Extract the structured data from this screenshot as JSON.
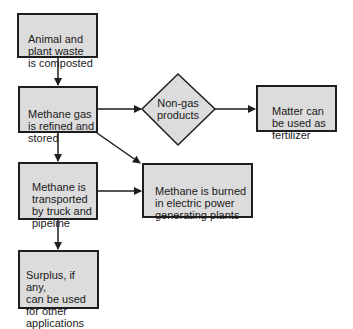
{
  "diagram": {
    "type": "flowchart",
    "colors": {
      "box_fill": "#dcdcdc",
      "border": "#1e1e1e",
      "text": "#1a1a1a",
      "background": "#ffffff"
    },
    "nodes": [
      {
        "id": "composted",
        "shape": "rect",
        "text": "Animal and\nplant waste\nis composted"
      },
      {
        "id": "refined",
        "shape": "rect",
        "text": "Methane gas\nis refined and\nstored"
      },
      {
        "id": "non_gas",
        "shape": "diamond",
        "text": "Non-gas\nproducts"
      },
      {
        "id": "fertilizer",
        "shape": "rect",
        "text": "Matter can\nbe used as\nfertilizer"
      },
      {
        "id": "transported",
        "shape": "rect",
        "text": "Methane is\ntransported\nby truck and\npipeline"
      },
      {
        "id": "burned",
        "shape": "rect",
        "text": "Methane is burned\nin electric power\ngenerating plants"
      },
      {
        "id": "surplus",
        "shape": "rect",
        "text": "Surplus, if any,\ncan be used\nfor other\napplications"
      }
    ],
    "edges": [
      {
        "from": "composted",
        "to": "refined"
      },
      {
        "from": "refined",
        "to": "non_gas"
      },
      {
        "from": "non_gas",
        "to": "fertilizer"
      },
      {
        "from": "refined",
        "to": "transported"
      },
      {
        "from": "refined",
        "to": "burned"
      },
      {
        "from": "transported",
        "to": "burned"
      },
      {
        "from": "transported",
        "to": "surplus"
      }
    ]
  }
}
